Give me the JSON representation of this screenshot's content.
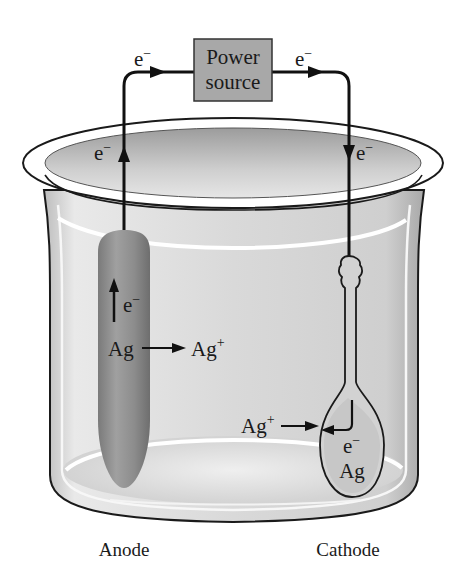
{
  "diagram": {
    "topic": "Electroplating of silver",
    "power_source": {
      "line1": "Power",
      "line2": "source",
      "fill": "#a8a8a8"
    },
    "electron_labels": {
      "top_left": "e",
      "top_right": "e",
      "rim_left": "e",
      "rim_right": "e",
      "anode": "e",
      "cathode": "e",
      "charge_minus": "−"
    },
    "anode": {
      "label": "Anode",
      "reaction_reactant": "Ag",
      "reaction_product": "Ag",
      "product_charge": "+"
    },
    "cathode": {
      "label": "Cathode",
      "incoming_ion": "Ag",
      "ion_charge": "+",
      "deposit": "Ag"
    },
    "colors": {
      "wire": "#111111",
      "solution": "#d6d6d6",
      "anode_metal": "#8f8f8f",
      "beaker_outline": "#1a1a1a"
    }
  }
}
